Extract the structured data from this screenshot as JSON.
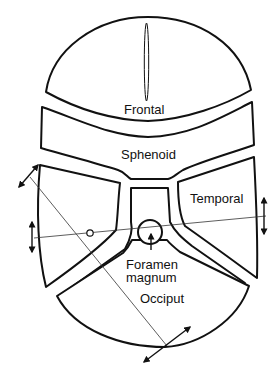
{
  "diagram": {
    "labels": {
      "frontal": "Frontal",
      "sphenoid": "Sphenoid",
      "temporal": "Temporal",
      "foramen_line1": "Foramen",
      "foramen_line2": "magnum",
      "occiput": "Occiput"
    },
    "colors": {
      "stroke": "#111111",
      "background": "#ffffff"
    },
    "markers": {
      "axis_lines": 2,
      "double_arrows": 4,
      "pivot_circle": 1
    }
  }
}
